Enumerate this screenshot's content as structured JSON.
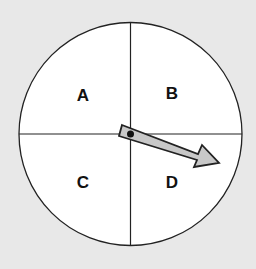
{
  "spinner": {
    "sections": [
      {
        "label": "A",
        "position": "top-left"
      },
      {
        "label": "B",
        "position": "top-right"
      },
      {
        "label": "C",
        "position": "bottom-left"
      },
      {
        "label": "D",
        "position": "bottom-right"
      }
    ],
    "arrow": {
      "points_to": "D",
      "color": "#c8c8c8"
    },
    "background": "#e8e8e8",
    "face_color": "#ffffff"
  }
}
